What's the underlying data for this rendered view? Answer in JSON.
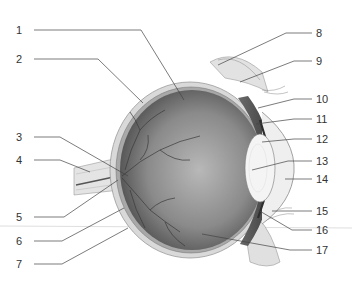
{
  "diagram": {
    "left_labels": [
      {
        "num": "1",
        "x": 22,
        "y": 30
      },
      {
        "num": "2",
        "x": 22,
        "y": 59
      },
      {
        "num": "3",
        "x": 22,
        "y": 137
      },
      {
        "num": "4",
        "x": 22,
        "y": 160
      },
      {
        "num": "5",
        "x": 22,
        "y": 217
      },
      {
        "num": "6",
        "x": 22,
        "y": 241
      },
      {
        "num": "7",
        "x": 22,
        "y": 264
      }
    ],
    "right_labels": [
      {
        "num": "8",
        "x": 316,
        "y": 33
      },
      {
        "num": "9",
        "x": 316,
        "y": 61
      },
      {
        "num": "10",
        "x": 316,
        "y": 99
      },
      {
        "num": "11",
        "x": 316,
        "y": 119
      },
      {
        "num": "12",
        "x": 316,
        "y": 139
      },
      {
        "num": "13",
        "x": 316,
        "y": 161
      },
      {
        "num": "14",
        "x": 316,
        "y": 179
      },
      {
        "num": "15",
        "x": 316,
        "y": 211
      },
      {
        "num": "16",
        "x": 316,
        "y": 230
      },
      {
        "num": "17",
        "x": 316,
        "y": 250
      }
    ],
    "colors": {
      "label_text": "#333333",
      "leader_line": "#444444",
      "eyeball_dark": "#5a5a5a",
      "eyeball_light": "#bdbdbd",
      "sclera": "#d9d9d9",
      "lens": "#f4f4f4",
      "vessel": "#3a3a3a"
    }
  }
}
